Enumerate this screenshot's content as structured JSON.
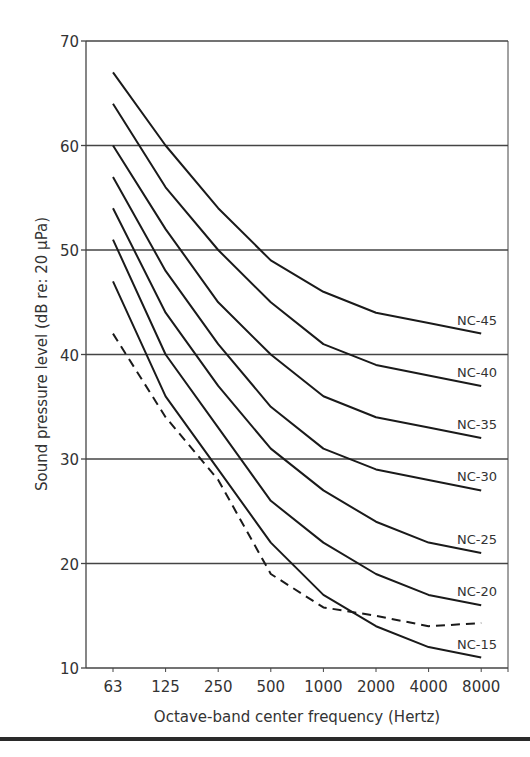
{
  "chart_data": {
    "type": "line",
    "title": "",
    "xlabel": "Octave-band center frequency (Hertz)",
    "ylabel": "Sound pressure level (dB re: 20 μPa)",
    "x": [
      "63",
      "125",
      "250",
      "500",
      "1000",
      "2000",
      "4000",
      "8000"
    ],
    "ylim": [
      10,
      70
    ],
    "yticks": [
      10,
      20,
      30,
      40,
      50,
      60,
      70
    ],
    "grid": "horizontal",
    "legend": "inline labels at right end of each curve",
    "series": [
      {
        "name": "NC-45",
        "style": "solid",
        "values": [
          67,
          60,
          54,
          49,
          46,
          44,
          43,
          42
        ]
      },
      {
        "name": "NC-40",
        "style": "solid",
        "values": [
          64,
          56,
          50,
          45,
          41,
          39,
          38,
          37
        ]
      },
      {
        "name": "NC-35",
        "style": "solid",
        "values": [
          60,
          52,
          45,
          40,
          36,
          34,
          33,
          32
        ]
      },
      {
        "name": "NC-30",
        "style": "solid",
        "values": [
          57,
          48,
          41,
          35,
          31,
          29,
          28,
          27
        ]
      },
      {
        "name": "NC-25",
        "style": "solid",
        "values": [
          54,
          44,
          37,
          31,
          27,
          24,
          22,
          21
        ]
      },
      {
        "name": "NC-20",
        "style": "solid",
        "values": [
          51,
          40,
          33,
          26,
          22,
          19,
          17,
          16
        ]
      },
      {
        "name": "NC-15",
        "style": "solid",
        "values": [
          47,
          36,
          29,
          22,
          17,
          14,
          12,
          11
        ]
      },
      {
        "name": "",
        "style": "dashed",
        "values": [
          42,
          34,
          28,
          19,
          15.8,
          15,
          14,
          14.3
        ]
      }
    ]
  },
  "axes": {
    "xlabel": "Octave-band center frequency (Hertz)",
    "ylabel": "Sound pressure level (dB re: 20 μPa)"
  },
  "colors": {
    "line": "#1a1a1a",
    "grid": "#444444",
    "text": "#333333"
  }
}
